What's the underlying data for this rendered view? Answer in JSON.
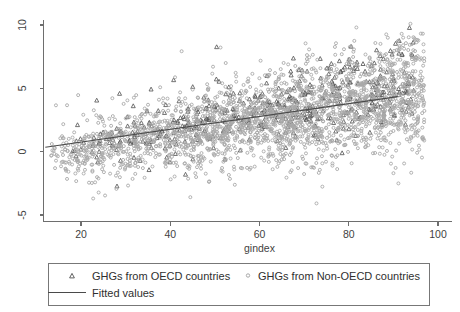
{
  "chart_data": {
    "type": "scatter",
    "title": "",
    "xlabel": "gindex",
    "ylabel": "",
    "xlim": [
      10,
      103
    ],
    "ylim": [
      -6.2,
      10.8
    ],
    "xticks": [
      20,
      40,
      60,
      80,
      100
    ],
    "yticks": [
      -5,
      0,
      5,
      10
    ],
    "xtick_labels": [
      "20",
      "40",
      "60",
      "80",
      "100"
    ],
    "ytick_labels": [
      "-5",
      "0",
      "5",
      "10"
    ],
    "grid": false,
    "legend_position": "below-axes",
    "series": [
      {
        "name": "GHGs from OECD countries",
        "marker": "triangle",
        "color": "#585858",
        "point_count": 520,
        "x_range": [
          18,
          95
        ],
        "y_center_intercept": -0.55,
        "y_center_slope": 0.062,
        "y_spread": 1.35,
        "seed": 20117
      },
      {
        "name": "GHGs from Non-OECD countries",
        "marker": "circle",
        "color": "#a9a9a9",
        "point_count": 2300,
        "x_range": [
          13,
          97
        ],
        "y_center_intercept": -1.15,
        "y_center_slope": 0.06,
        "y_spread": 1.95,
        "seed": 90431
      }
    ],
    "fitted_line": {
      "name": "Fitted values",
      "color": "#4a4a4a",
      "x_start": 12,
      "x_end": 91,
      "y_start": 0.35,
      "y_end": 4.35
    }
  },
  "legend": {
    "entries": [
      {
        "label": "GHGs from OECD countries",
        "marker": "triangle"
      },
      {
        "label": "GHGs from Non-OECD countries",
        "marker": "circle"
      },
      {
        "label": "Fitted values",
        "marker": "line"
      }
    ]
  },
  "axes": {
    "x_title": "gindex"
  }
}
